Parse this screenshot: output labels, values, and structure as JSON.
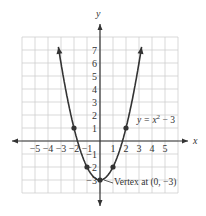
{
  "chart_data": {
    "type": "line",
    "title": "",
    "xlabel": "x",
    "ylabel": "y",
    "xlim": [
      -6,
      6
    ],
    "ylim": [
      -4,
      8
    ],
    "grid": true,
    "x_ticks": [
      "-5",
      "-4",
      "-3",
      "-2",
      "-1",
      "1",
      "2",
      "3",
      "4",
      "5"
    ],
    "y_ticks": [
      "7",
      "6",
      "5",
      "4",
      "3",
      "2",
      "1",
      "-1",
      "-2",
      "-3"
    ],
    "series": [
      {
        "name": "y = x² − 3",
        "equation": "y = x^2 - 3"
      }
    ],
    "points": [
      {
        "x": -2,
        "y": 1
      },
      {
        "x": -1,
        "y": -2
      },
      {
        "x": 0,
        "y": -3
      },
      {
        "x": 1,
        "y": -2
      },
      {
        "x": 2,
        "y": 1
      }
    ],
    "annotations": [
      {
        "text": "Vertex at (0, −3)",
        "x": 0,
        "y": -3
      },
      {
        "text": "y = x² − 3"
      }
    ]
  },
  "labels": {
    "x_axis": "x",
    "y_axis": "y",
    "equation_prefix": "y = x",
    "equation_exp": "2",
    "equation_suffix": " − 3",
    "vertex": "Vertex at (0, −3)"
  }
}
